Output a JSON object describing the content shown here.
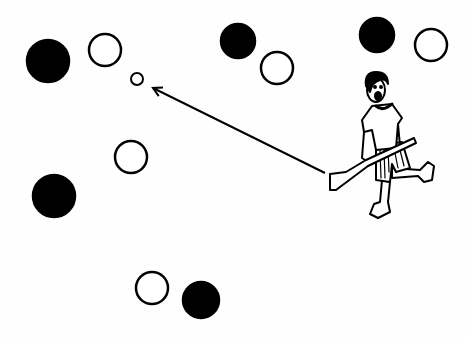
{
  "illustration": {
    "subject": "hurling player striking sliotar toward space between players",
    "colors": {
      "ink": "#000000",
      "paper": "#fefefe"
    },
    "players_black": [
      {
        "cx": 48,
        "cy": 61,
        "r": 21
      },
      {
        "cx": 238,
        "cy": 41,
        "r": 17
      },
      {
        "cx": 377,
        "cy": 35,
        "r": 17
      },
      {
        "cx": 54,
        "cy": 196,
        "r": 21
      },
      {
        "cx": 201,
        "cy": 300,
        "r": 18
      }
    ],
    "players_white": [
      {
        "cx": 105,
        "cy": 50,
        "r": 16
      },
      {
        "cx": 277,
        "cy": 68,
        "r": 16
      },
      {
        "cx": 431,
        "cy": 45,
        "r": 16
      },
      {
        "cx": 131,
        "cy": 157,
        "r": 16
      },
      {
        "cx": 152,
        "cy": 288,
        "r": 16
      }
    ],
    "ball": {
      "cx": 137,
      "cy": 79,
      "r": 6
    },
    "arrow": {
      "x1": 325,
      "y1": 173,
      "x2": 153,
      "y2": 88
    }
  }
}
